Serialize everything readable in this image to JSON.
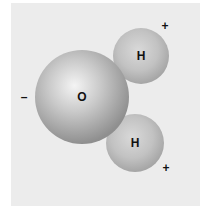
{
  "diagram": {
    "background": "#ececec",
    "atoms": [
      {
        "id": "oxygen",
        "label": "O",
        "cx": 82,
        "cy": 97,
        "r": 47
      },
      {
        "id": "hydrogen-top",
        "label": "H",
        "cx": 141,
        "cy": 56,
        "r": 28
      },
      {
        "id": "hydrogen-bottom",
        "label": "H",
        "cx": 135,
        "cy": 143,
        "r": 29
      }
    ],
    "charges": [
      {
        "id": "oxygen-charge",
        "symbol": "–",
        "x": 24,
        "y": 97
      },
      {
        "id": "hydrogen-top-charge",
        "symbol": "+",
        "x": 165,
        "y": 26
      },
      {
        "id": "hydrogen-bottom-charge",
        "symbol": "+",
        "x": 166,
        "y": 168
      }
    ]
  }
}
